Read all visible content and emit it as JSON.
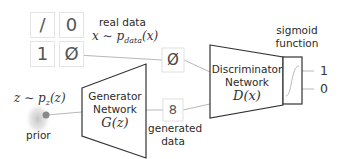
{
  "real_data": {
    "label": "real data",
    "distribution": "x ∼ p",
    "distribution_sub": "data",
    "distribution_tail": "(x)",
    "digits": [
      "/",
      "0",
      "1",
      "Ø"
    ],
    "sample": "Ø"
  },
  "prior": {
    "distribution": "z ∼ p",
    "distribution_sub": "z",
    "distribution_tail": "(z)",
    "label": "prior"
  },
  "generator": {
    "line1": "Generator",
    "line2": "Network",
    "func": "G(z)"
  },
  "generated": {
    "line1": "generated",
    "line2": "data",
    "sample": "8"
  },
  "discriminator": {
    "line1": "Discriminator",
    "line2": "Network",
    "func": "D(x)"
  },
  "sigmoid": {
    "line1": "sigmoid",
    "line2": "function"
  },
  "outputs": [
    "1",
    "0"
  ],
  "colors": {
    "stroke": "#333333",
    "connector": "#b5b5b5",
    "prior_dot": "#8a8a8a"
  }
}
